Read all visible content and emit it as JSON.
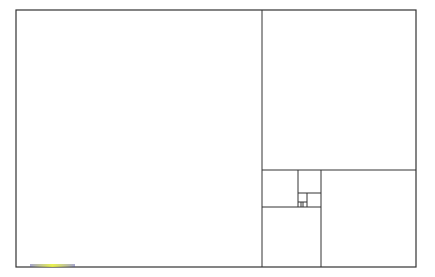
{
  "diagram": {
    "title": "",
    "stroke_color": "#333333",
    "background_color": "#ffffff",
    "outer": {
      "x": 16,
      "y": 10,
      "w": 400,
      "h": 257
    },
    "lines": [
      {
        "name": "divider-1-vertical",
        "x1": 262,
        "y1": 10,
        "x2": 262,
        "y2": 267
      },
      {
        "name": "divider-2-horizontal",
        "x1": 262,
        "y1": 170,
        "x2": 416,
        "y2": 170
      },
      {
        "name": "divider-3-vertical",
        "x1": 321,
        "y1": 170,
        "x2": 321,
        "y2": 267
      },
      {
        "name": "divider-4-horizontal",
        "x1": 262,
        "y1": 207,
        "x2": 321,
        "y2": 207
      },
      {
        "name": "divider-5-vertical",
        "x1": 298,
        "y1": 170,
        "x2": 298,
        "y2": 207
      },
      {
        "name": "divider-6-horizontal",
        "x1": 298,
        "y1": 193,
        "x2": 321,
        "y2": 193
      },
      {
        "name": "divider-7-vertical",
        "x1": 307,
        "y1": 193,
        "x2": 307,
        "y2": 207
      },
      {
        "name": "divider-8-horizontal",
        "x1": 298,
        "y1": 202,
        "x2": 307,
        "y2": 202
      },
      {
        "name": "divider-9-vertical",
        "x1": 301,
        "y1": 202,
        "x2": 301,
        "y2": 207
      },
      {
        "name": "divider-10-vertical",
        "x1": 303,
        "y1": 202,
        "x2": 303,
        "y2": 207
      }
    ]
  }
}
